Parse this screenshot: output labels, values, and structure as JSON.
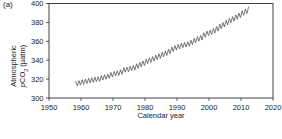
{
  "figure": {
    "panel_label": "(a)"
  },
  "axes": {
    "y": {
      "title_line1": "Atmospheric",
      "title_p": "p",
      "title_co": "CO",
      "title_sub": "2",
      "title_unit": " (µatm)",
      "ticks": [
        300,
        320,
        340,
        360,
        380,
        400
      ],
      "range": [
        300,
        400
      ]
    },
    "x": {
      "title": "Calendar year",
      "ticks": [
        1950,
        1960,
        1970,
        1980,
        1990,
        2000,
        2010,
        2020
      ],
      "range": [
        1950,
        2020
      ]
    }
  },
  "colors": {
    "background": "#ffffff",
    "axis": "#2e2e2e",
    "text": "#1a1a1a",
    "line": "#4d4d4d"
  },
  "chart_data": {
    "type": "line",
    "title": "",
    "xlabel": "Calendar year",
    "ylabel": "Atmospheric pCO2 (µatm)",
    "xlim": [
      1950,
      2020
    ],
    "ylim": [
      300,
      400
    ],
    "grid": false,
    "legend": "none",
    "seasonal_half_amplitude_uatm": 2.4,
    "series": [
      {
        "name": "Atmospheric pCO2 annual mean",
        "x": [
          1958,
          1959,
          1960,
          1961,
          1962,
          1963,
          1964,
          1965,
          1966,
          1967,
          1968,
          1969,
          1970,
          1971,
          1972,
          1973,
          1974,
          1975,
          1976,
          1977,
          1978,
          1979,
          1980,
          1981,
          1982,
          1983,
          1984,
          1985,
          1986,
          1987,
          1988,
          1989,
          1990,
          1991,
          1992,
          1993,
          1994,
          1995,
          1996,
          1997,
          1998,
          1999,
          2000,
          2001,
          2002,
          2003,
          2004,
          2005,
          2006,
          2007,
          2008,
          2009,
          2010,
          2011,
          2012
        ],
        "y": [
          315.2,
          316.0,
          316.9,
          317.6,
          318.5,
          319.0,
          319.6,
          320.0,
          321.4,
          322.2,
          323.0,
          324.6,
          325.7,
          326.3,
          327.5,
          329.7,
          330.2,
          331.1,
          332.0,
          333.8,
          335.4,
          336.8,
          338.8,
          340.1,
          341.4,
          343.0,
          344.4,
          346.0,
          347.4,
          349.2,
          351.6,
          353.1,
          354.4,
          355.6,
          356.4,
          357.1,
          358.8,
          360.8,
          362.6,
          363.7,
          366.7,
          368.4,
          369.5,
          371.1,
          373.2,
          375.8,
          377.5,
          379.8,
          381.9,
          383.8,
          385.6,
          387.4,
          389.9,
          391.6,
          393.8
        ]
      }
    ]
  }
}
